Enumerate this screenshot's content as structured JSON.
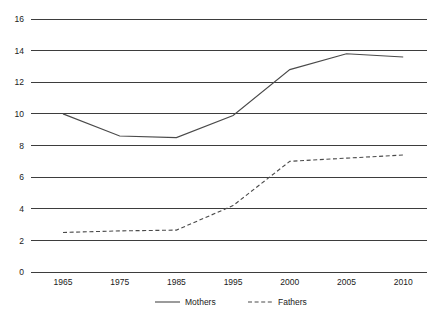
{
  "chart_data": {
    "type": "line",
    "title": "",
    "xlabel": "",
    "ylabel": "",
    "categories": [
      "1965",
      "1975",
      "1985",
      "1995",
      "2000",
      "2005",
      "2010"
    ],
    "ylim": [
      0,
      16
    ],
    "y_ticks": [
      "0",
      "2",
      "4",
      "6",
      "8",
      "10",
      "12",
      "14",
      "16"
    ],
    "grid": true,
    "legend_position": "bottom",
    "series": [
      {
        "name": "Mothers",
        "style": "solid",
        "color": "#4a4a4a",
        "values": [
          10.0,
          8.6,
          8.5,
          9.9,
          12.8,
          13.8,
          13.6
        ]
      },
      {
        "name": "Fathers",
        "style": "dashed",
        "color": "#4a4a4a",
        "values": [
          2.5,
          2.6,
          2.65,
          4.2,
          7.0,
          7.2,
          7.4
        ]
      }
    ]
  },
  "axes": {
    "y_tick_labels": [
      "16",
      "14",
      "12",
      "10",
      "8",
      "6",
      "4",
      "2",
      "0"
    ],
    "x_tick_labels": [
      "1965",
      "1975",
      "1985",
      "1995",
      "2000",
      "2005",
      "2010"
    ]
  },
  "legend": {
    "items": [
      {
        "label": "Mothers",
        "style": "solid"
      },
      {
        "label": "Fathers",
        "style": "dashed"
      }
    ]
  }
}
